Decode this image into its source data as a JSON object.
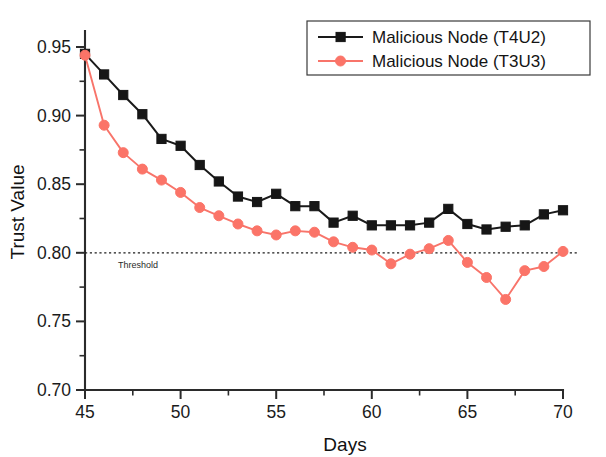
{
  "chart_data": {
    "type": "line",
    "title": "",
    "xlabel": "Days",
    "ylabel": "Trust Value",
    "xlim": [
      45,
      70
    ],
    "ylim": [
      0.7,
      0.955
    ],
    "grid": false,
    "legend_position": "top-right",
    "x_ticks": [
      45,
      50,
      55,
      60,
      65,
      70
    ],
    "x_tick_labels": [
      "45",
      "50",
      "55",
      "60",
      "65",
      "70"
    ],
    "x_minor_step": 2.5,
    "y_ticks": [
      0.7,
      0.75,
      0.8,
      0.85,
      0.9,
      0.95
    ],
    "y_tick_labels": [
      "0.70",
      "0.75",
      "0.80",
      "0.85",
      "0.90",
      "0.95"
    ],
    "y_minor_step": 0.025,
    "x": [
      45,
      46,
      47,
      48,
      49,
      50,
      51,
      52,
      53,
      54,
      55,
      56,
      57,
      58,
      59,
      60,
      61,
      62,
      63,
      64,
      65,
      66,
      67,
      68,
      69,
      70
    ],
    "series": [
      {
        "name": "Malicious Node (T4U2)",
        "color": "#161616",
        "marker": "square",
        "values": [
          0.945,
          0.93,
          0.915,
          0.901,
          0.883,
          0.878,
          0.864,
          0.852,
          0.841,
          0.837,
          0.843,
          0.834,
          0.834,
          0.822,
          0.827,
          0.82,
          0.82,
          0.82,
          0.822,
          0.832,
          0.821,
          0.817,
          0.819,
          0.82,
          0.828,
          0.831
        ]
      },
      {
        "name": "Malicious Node (T3U3)",
        "color": "#fb7468",
        "marker": "circle",
        "values": [
          0.944,
          0.893,
          0.873,
          0.861,
          0.853,
          0.844,
          0.833,
          0.827,
          0.821,
          0.816,
          0.813,
          0.816,
          0.815,
          0.808,
          0.804,
          0.802,
          0.792,
          0.799,
          0.803,
          0.809,
          0.793,
          0.782,
          0.766,
          0.787,
          0.79,
          0.801
        ]
      }
    ],
    "annotations": [
      {
        "name": "threshold",
        "label": "Threshold",
        "value": 0.8,
        "style": "dotted-horizontal-line"
      }
    ]
  }
}
